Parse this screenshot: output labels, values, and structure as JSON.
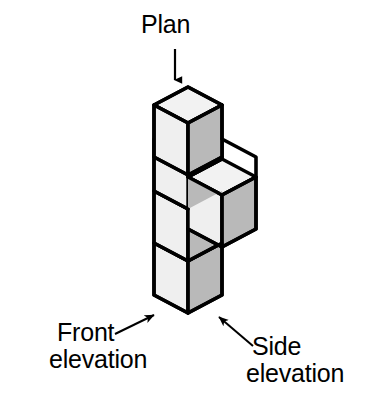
{
  "figure": {
    "kind": "isometric-cube-solid-with-view-labels",
    "background_color": "#ffffff",
    "outline_color": "#000000",
    "top_face_color": "#f2f2f2",
    "left_face_color": "#efefef",
    "right_face_color": "#b9b9b9",
    "labels": {
      "plan": "Plan",
      "front_line1": "Front",
      "front_line2": "elevation",
      "side_line1": "Side",
      "side_line2": "elevation"
    },
    "arrows": {
      "plan_arrow": {
        "from_x": 175,
        "from_y": 49,
        "to_x": 175,
        "to_y": 89,
        "direction": "down"
      },
      "front_arrow": {
        "from_x": 115,
        "from_y": 333,
        "to_x": 158,
        "to_y": 312,
        "direction": "up-right"
      },
      "side_arrow": {
        "from_x": 252,
        "from_y": 345,
        "to_x": 216,
        "to_y": 314,
        "direction": "up-left"
      }
    },
    "geometry": {
      "origin_x": 188,
      "origin_y": 313,
      "cube_half_width": 34,
      "cube_iso_rise": 18,
      "cube_height": 52,
      "column_cubes": 4,
      "protruding_cube_level_from_top": 2,
      "protruding_cube_direction": "right"
    },
    "cube_count_visible": 5
  }
}
